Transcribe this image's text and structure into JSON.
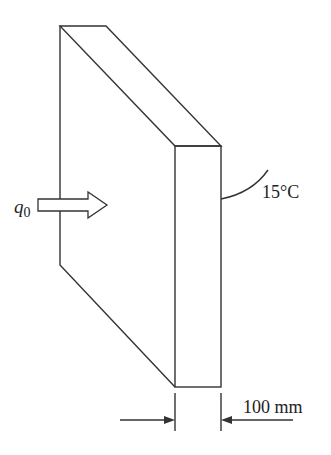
{
  "diagram": {
    "heat_flux_label": "q",
    "heat_flux_subscript": "0",
    "surface_temperature_label": "15°C",
    "thickness_label": "100 mm",
    "colors": {
      "stroke": "#333333",
      "text": "#222222",
      "background": "#ffffff"
    }
  }
}
